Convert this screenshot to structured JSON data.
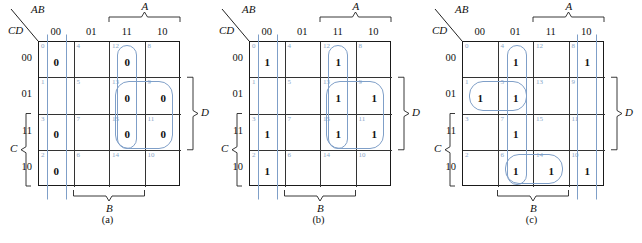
{
  "figure": {
    "kind": "karnaugh-maps",
    "accent_color": "#7f9fc8",
    "index_color": "#8aa6c8",
    "line_color": "#1a1a1a"
  },
  "axis_labels": {
    "top_left_upper": "AB",
    "top_left_lower": "CD",
    "col_headers": [
      "00",
      "01",
      "11",
      "10"
    ],
    "row_headers": [
      "00",
      "01",
      "11",
      "10"
    ],
    "bracket_top": "A",
    "bracket_bottom": "B",
    "bracket_left": "C",
    "bracket_right": "D"
  },
  "maps": [
    {
      "caption": "(a)",
      "fill_symbol": "0",
      "cells": [
        {
          "idx": "0",
          "row": 0,
          "col": 0,
          "value": "0"
        },
        {
          "idx": "4",
          "row": 0,
          "col": 1,
          "value": ""
        },
        {
          "idx": "12",
          "row": 0,
          "col": 2,
          "value": "0"
        },
        {
          "idx": "8",
          "row": 0,
          "col": 3,
          "value": ""
        },
        {
          "idx": "1",
          "row": 1,
          "col": 0,
          "value": ""
        },
        {
          "idx": "5",
          "row": 1,
          "col": 1,
          "value": ""
        },
        {
          "idx": "13",
          "row": 1,
          "col": 2,
          "value": "0"
        },
        {
          "idx": "9",
          "row": 1,
          "col": 3,
          "value": "0"
        },
        {
          "idx": "3",
          "row": 2,
          "col": 0,
          "value": "0"
        },
        {
          "idx": "7",
          "row": 2,
          "col": 1,
          "value": ""
        },
        {
          "idx": "15",
          "row": 2,
          "col": 2,
          "value": "0"
        },
        {
          "idx": "11",
          "row": 2,
          "col": 3,
          "value": "0"
        },
        {
          "idx": "2",
          "row": 3,
          "col": 0,
          "value": "0"
        },
        {
          "idx": "6",
          "row": 3,
          "col": 1,
          "value": ""
        },
        {
          "idx": "14",
          "row": 3,
          "col": 2,
          "value": ""
        },
        {
          "idx": "10",
          "row": 3,
          "col": 3,
          "value": ""
        }
      ],
      "groups": [
        {
          "name": "group-col00-wrap",
          "x": 8,
          "y": -8,
          "w": 20,
          "h": 166,
          "open": true
        },
        {
          "name": "group-col11-cells-12-13-15",
          "x": 78,
          "y": 3,
          "w": 20,
          "h": 104,
          "open": false
        },
        {
          "name": "group-quad-13-9-15-11",
          "x": 76,
          "y": 39,
          "w": 58,
          "h": 68,
          "open": false
        }
      ]
    },
    {
      "caption": "(b)",
      "fill_symbol": "1",
      "cells": [
        {
          "idx": "0",
          "row": 0,
          "col": 0,
          "value": "1"
        },
        {
          "idx": "4",
          "row": 0,
          "col": 1,
          "value": ""
        },
        {
          "idx": "12",
          "row": 0,
          "col": 2,
          "value": "1"
        },
        {
          "idx": "8",
          "row": 0,
          "col": 3,
          "value": ""
        },
        {
          "idx": "1",
          "row": 1,
          "col": 0,
          "value": ""
        },
        {
          "idx": "5",
          "row": 1,
          "col": 1,
          "value": ""
        },
        {
          "idx": "13",
          "row": 1,
          "col": 2,
          "value": "1"
        },
        {
          "idx": "9",
          "row": 1,
          "col": 3,
          "value": "1"
        },
        {
          "idx": "3",
          "row": 2,
          "col": 0,
          "value": "1"
        },
        {
          "idx": "7",
          "row": 2,
          "col": 1,
          "value": ""
        },
        {
          "idx": "15",
          "row": 2,
          "col": 2,
          "value": "1"
        },
        {
          "idx": "11",
          "row": 2,
          "col": 3,
          "value": "1"
        },
        {
          "idx": "2",
          "row": 3,
          "col": 0,
          "value": "1"
        },
        {
          "idx": "6",
          "row": 3,
          "col": 1,
          "value": ""
        },
        {
          "idx": "14",
          "row": 3,
          "col": 2,
          "value": ""
        },
        {
          "idx": "10",
          "row": 3,
          "col": 3,
          "value": ""
        }
      ],
      "groups": [
        {
          "name": "group-col00-wrap",
          "x": 8,
          "y": -8,
          "w": 20,
          "h": 166,
          "open": true
        },
        {
          "name": "group-col11-cells-12-13-15",
          "x": 78,
          "y": 3,
          "w": 20,
          "h": 104,
          "open": false
        },
        {
          "name": "group-quad-13-9-15-11",
          "x": 76,
          "y": 39,
          "w": 58,
          "h": 68,
          "open": false
        }
      ]
    },
    {
      "caption": "(c)",
      "fill_symbol": "1",
      "cells": [
        {
          "idx": "0",
          "row": 0,
          "col": 0,
          "value": ""
        },
        {
          "idx": "4",
          "row": 0,
          "col": 1,
          "value": "1"
        },
        {
          "idx": "12",
          "row": 0,
          "col": 2,
          "value": ""
        },
        {
          "idx": "8",
          "row": 0,
          "col": 3,
          "value": "1"
        },
        {
          "idx": "1",
          "row": 1,
          "col": 0,
          "value": "1"
        },
        {
          "idx": "5",
          "row": 1,
          "col": 1,
          "value": "1"
        },
        {
          "idx": "13",
          "row": 1,
          "col": 2,
          "value": ""
        },
        {
          "idx": "9",
          "row": 1,
          "col": 3,
          "value": ""
        },
        {
          "idx": "3",
          "row": 2,
          "col": 0,
          "value": ""
        },
        {
          "idx": "7",
          "row": 2,
          "col": 1,
          "value": "1"
        },
        {
          "idx": "15",
          "row": 2,
          "col": 2,
          "value": ""
        },
        {
          "idx": "11",
          "row": 2,
          "col": 3,
          "value": ""
        },
        {
          "idx": "2",
          "row": 3,
          "col": 0,
          "value": ""
        },
        {
          "idx": "6",
          "row": 3,
          "col": 1,
          "value": "1"
        },
        {
          "idx": "14",
          "row": 3,
          "col": 2,
          "value": "1"
        },
        {
          "idx": "10",
          "row": 3,
          "col": 3,
          "value": "1"
        }
      ],
      "groups": [
        {
          "name": "group-col01-full",
          "x": 44,
          "y": 3,
          "w": 20,
          "h": 140,
          "open": false
        },
        {
          "name": "group-row01-cells-1-5",
          "x": 6,
          "y": 39,
          "w": 58,
          "h": 30,
          "open": false
        },
        {
          "name": "group-row10-cells-6-14",
          "x": 42,
          "y": 112,
          "w": 58,
          "h": 30,
          "open": false
        },
        {
          "name": "group-col10-wrap-8-10",
          "x": 114,
          "y": -8,
          "w": 20,
          "h": 166,
          "open": true
        }
      ]
    }
  ]
}
